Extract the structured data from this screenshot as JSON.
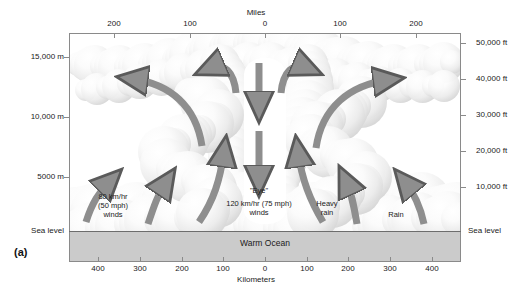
{
  "figure": {
    "letter": "(a)",
    "ocean_label": "Warm Ocean",
    "sea_level_left": "Sea level",
    "sea_level_right": "Sea level"
  },
  "axes": {
    "top": {
      "title": "Miles",
      "ticks": [
        "200",
        "100",
        "0",
        "100",
        "200"
      ]
    },
    "bottom": {
      "title": "Kilometers",
      "ticks": [
        "400",
        "300",
        "200",
        "100",
        "0",
        "100",
        "200",
        "300",
        "400"
      ]
    },
    "left": {
      "ticks": [
        "15,000 m",
        "10,000 m",
        "5000 m"
      ]
    },
    "right": {
      "ticks": [
        "50,000 ft",
        "40,000 ft",
        "30,000 ft",
        "20,000 ft",
        "10,000 ft"
      ]
    }
  },
  "annotations": {
    "eye": "\"Eye\"",
    "eyewall_winds": "120 km/hr (75 mph)\nwinds",
    "eyewall_winds_line1": "120 km/hr (75 mph)",
    "eyewall_winds_line2": "winds",
    "outer_winds_line1": "80 km/hr",
    "outer_winds_line2": "(50 mph)",
    "outer_winds_line3": "winds",
    "heavy_rain_line1": "Heavy",
    "heavy_rain_line2": "rain",
    "rain": "Rain"
  },
  "colors": {
    "arrow_fill": "#8e8e8e",
    "arrow_stroke": "#5a5a5a",
    "ocean_fill": "#cbcbcb",
    "frame_stroke": "#8a8a8a",
    "text": "#1a1a1a"
  },
  "chart_data": {
    "type": "diagram",
    "xlabel_top": "Miles",
    "xlabel_bottom": "Kilometers",
    "x_top_ticks": [
      -200,
      -100,
      0,
      100,
      200
    ],
    "x_bottom_ticks": [
      -400,
      -300,
      -200,
      -100,
      0,
      100,
      200,
      300,
      400
    ],
    "y_left_ticks_m": [
      15000,
      10000,
      5000
    ],
    "y_right_ticks_ft": [
      50000,
      40000,
      30000,
      20000,
      10000
    ],
    "features": [
      {
        "name": "eye",
        "x_km": 0,
        "description": "calm central eye with sinking air"
      },
      {
        "name": "eyewall",
        "x_km": [
          -60,
          60
        ],
        "wind_kmh": 120,
        "wind_mph": 75
      },
      {
        "name": "outer-rainbands",
        "x_km": [
          -400,
          -200
        ],
        "wind_kmh": 80,
        "wind_mph": 50
      },
      {
        "name": "heavy-rain",
        "x_km": 120
      },
      {
        "name": "rain",
        "x_km": 330
      },
      {
        "name": "warm-ocean",
        "y": "below sea level"
      }
    ],
    "flows": [
      {
        "name": "inflow",
        "direction": "toward eyewall at sea level"
      },
      {
        "name": "updraft",
        "direction": "rising in eyewall"
      },
      {
        "name": "outflow",
        "direction": "outward at 12-15 km altitude"
      },
      {
        "name": "subsidence",
        "direction": "sinking in eye"
      }
    ]
  }
}
